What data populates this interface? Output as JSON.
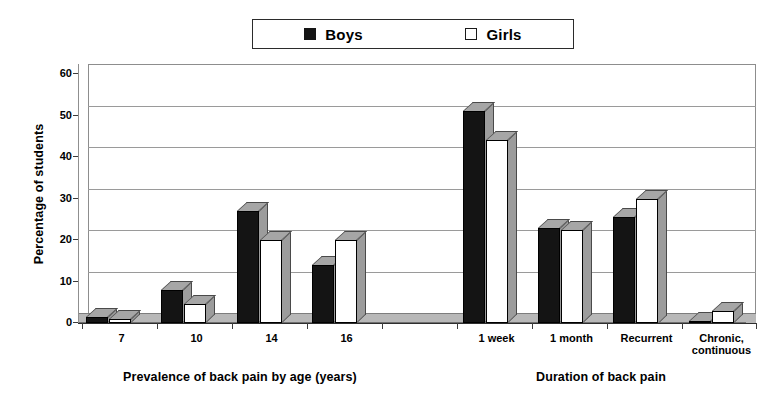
{
  "legend": {
    "entries": [
      {
        "label": "Boys",
        "marker": "filled-square",
        "color": "#141414"
      },
      {
        "label": "Girls",
        "marker": "open-square",
        "color": "#ffffff"
      }
    ]
  },
  "axes": {
    "ylabel": "Percentage of students",
    "yticks": [
      "0",
      "10",
      "20",
      "30",
      "40",
      "50",
      "60"
    ],
    "group_titles": [
      "Prevalence of back pain by age (years)",
      "Duration of back pain"
    ]
  },
  "chart_data": {
    "type": "bar",
    "title": "",
    "xlabel": "",
    "ylabel": "Percentage of students",
    "ylim": [
      0,
      60
    ],
    "ytick_step": 10,
    "grid": true,
    "legend_position": "top-center",
    "style": "3d-clustered-column",
    "categories": [
      "7",
      "10",
      "14",
      "16",
      "",
      "1 week",
      "1 month",
      "Recurrent",
      "Chronic,\ncontinuous"
    ],
    "category_groups": [
      {
        "title": "Prevalence of back pain by age (years)",
        "categories": [
          "7",
          "10",
          "14",
          "16"
        ]
      },
      {
        "title": "Duration of back pain",
        "categories": [
          "1 week",
          "1 month",
          "Recurrent",
          "Chronic, continuous"
        ]
      }
    ],
    "series": [
      {
        "name": "Boys",
        "color": "#141414",
        "values": [
          1.5,
          8,
          27,
          14,
          null,
          51,
          23,
          25.5,
          0.5
        ]
      },
      {
        "name": "Girls",
        "color": "#ffffff",
        "values": [
          1,
          4.5,
          20,
          20,
          null,
          44,
          22.5,
          30,
          3
        ]
      }
    ]
  }
}
